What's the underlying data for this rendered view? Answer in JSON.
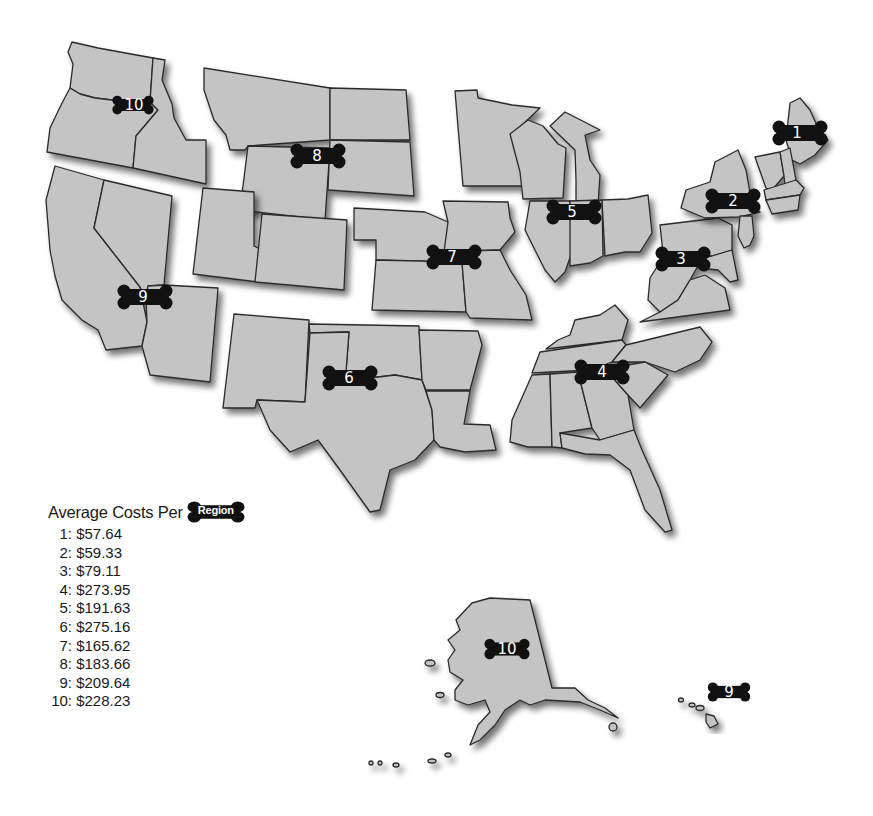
{
  "legend": {
    "title": "Average Costs Per",
    "title_badge": "Region",
    "items": [
      {
        "region": "1:",
        "cost": "$57.64"
      },
      {
        "region": "2:",
        "cost": "$59.33"
      },
      {
        "region": "3:",
        "cost": "$79.11"
      },
      {
        "region": "4:",
        "cost": "$273.95"
      },
      {
        "region": "5:",
        "cost": "$191.63"
      },
      {
        "region": "6:",
        "cost": "$275.16"
      },
      {
        "region": "7:",
        "cost": "$165.62"
      },
      {
        "region": "8:",
        "cost": "$183.66"
      },
      {
        "region": "9:",
        "cost": "$209.64"
      },
      {
        "region": "10:",
        "cost": "$228.23"
      }
    ]
  },
  "map": {
    "badges": [
      {
        "label": "1",
        "region": "Northeast (ME, NH, VT, MA, RI, CT)"
      },
      {
        "label": "2",
        "region": "NY, NJ"
      },
      {
        "label": "3",
        "region": "PA, MD, DE, WV, VA"
      },
      {
        "label": "4",
        "region": "Southeast"
      },
      {
        "label": "5",
        "region": "Great Lakes"
      },
      {
        "label": "6",
        "region": "South Central"
      },
      {
        "label": "7",
        "region": "Plains"
      },
      {
        "label": "8",
        "region": "Northern Rockies/Dakotas"
      },
      {
        "label": "9",
        "region": "Southwest (CA, NV, AZ)"
      },
      {
        "label": "10",
        "region": "Pacific Northwest (WA, OR, ID)"
      },
      {
        "label": "10",
        "region": "Alaska"
      },
      {
        "label": "9",
        "region": "Hawaii"
      }
    ],
    "colors": {
      "land": "#c4c4c4",
      "border": "#2a2a2a",
      "badge": "#111111",
      "badge_text": "#ffffff"
    }
  }
}
